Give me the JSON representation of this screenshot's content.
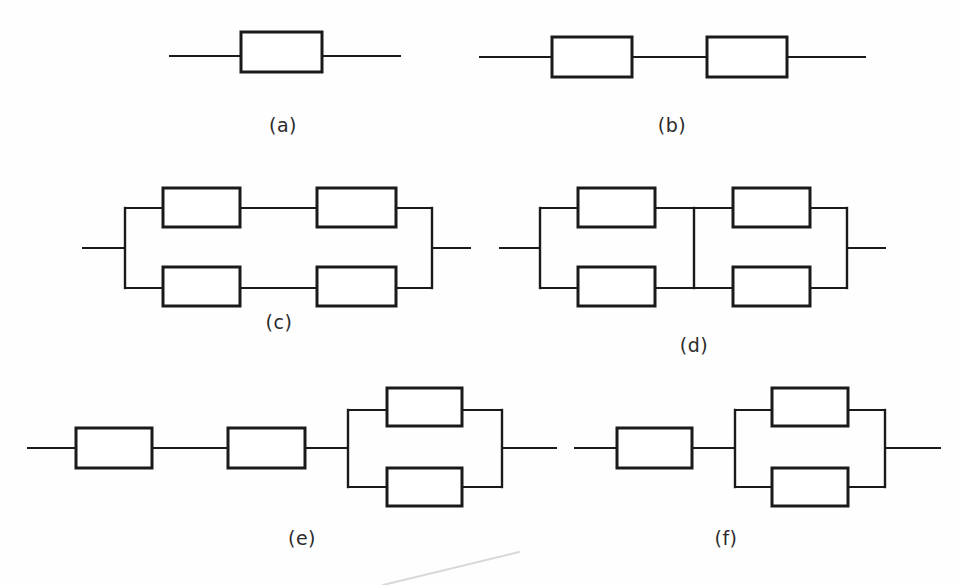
{
  "figure": {
    "background_color": "#fefefe",
    "line_color": "#1a1a1a",
    "block_fill": "#ffffff",
    "caption_color": "#2b2b2b",
    "width": 959,
    "height": 585,
    "block_count_total": 17,
    "stroke_width_block": 3,
    "stroke_width_wire": 2
  },
  "diagrams": [
    {
      "id": "a",
      "caption": "(a)",
      "caption_x": 283,
      "caption_y": 125,
      "topology": "single block in series",
      "block_count": 1,
      "blocks": [
        {
          "name": "block-a1",
          "x": 241,
          "y": 32,
          "w": 81,
          "h": 40
        }
      ],
      "wires": [
        {
          "name": "lead-in",
          "x1": 170,
          "y1": 56,
          "x2": 241,
          "y2": 56
        },
        {
          "name": "lead-out",
          "x1": 322,
          "y1": 56,
          "x2": 400,
          "y2": 56
        }
      ]
    },
    {
      "id": "b",
      "caption": "(b)",
      "caption_x": 672,
      "caption_y": 125,
      "topology": "two blocks in series",
      "block_count": 2,
      "blocks": [
        {
          "name": "block-b1",
          "x": 552,
          "y": 37,
          "w": 80,
          "h": 40
        },
        {
          "name": "block-b2",
          "x": 707,
          "y": 37,
          "w": 80,
          "h": 40
        }
      ],
      "wires": [
        {
          "name": "lead-in",
          "x1": 480,
          "y1": 57,
          "x2": 552,
          "y2": 57
        },
        {
          "name": "link-b1-b2",
          "x1": 632,
          "y1": 57,
          "x2": 707,
          "y2": 57
        },
        {
          "name": "lead-out",
          "x1": 787,
          "y1": 57,
          "x2": 865,
          "y2": 57
        }
      ]
    },
    {
      "id": "c",
      "caption": "(c)",
      "caption_x": 279,
      "caption_y": 322,
      "topology": "two parallel paths, each of two series blocks",
      "block_count": 4,
      "blocks": [
        {
          "name": "block-c1",
          "x": 163,
          "y": 188,
          "w": 77,
          "h": 39
        },
        {
          "name": "block-c2",
          "x": 317,
          "y": 188,
          "w": 79,
          "h": 39
        },
        {
          "name": "block-c3",
          "x": 163,
          "y": 267,
          "w": 77,
          "h": 39
        },
        {
          "name": "block-c4",
          "x": 317,
          "y": 267,
          "w": 79,
          "h": 39
        }
      ],
      "rails": [
        {
          "name": "left-rail",
          "x": 125,
          "y1": 208,
          "y2": 288
        },
        {
          "name": "right-rail",
          "x": 432,
          "y1": 208,
          "y2": 288
        }
      ],
      "wires": [
        {
          "name": "lead-in",
          "x1": 83,
          "y1": 248,
          "x2": 125,
          "y2": 248
        },
        {
          "name": "lead-out",
          "x1": 432,
          "y1": 248,
          "x2": 470,
          "y2": 248
        },
        {
          "name": "top-left-stub",
          "x1": 125,
          "y1": 208,
          "x2": 163,
          "y2": 208
        },
        {
          "name": "top-mid-link",
          "x1": 240,
          "y1": 208,
          "x2": 317,
          "y2": 208
        },
        {
          "name": "top-right-stub",
          "x1": 396,
          "y1": 208,
          "x2": 432,
          "y2": 208
        },
        {
          "name": "bottom-left-stub",
          "x1": 125,
          "y1": 288,
          "x2": 163,
          "y2": 288
        },
        {
          "name": "bottom-mid-link",
          "x1": 240,
          "y1": 288,
          "x2": 317,
          "y2": 288
        },
        {
          "name": "bottom-right-stub",
          "x1": 396,
          "y1": 288,
          "x2": 432,
          "y2": 288
        }
      ]
    },
    {
      "id": "d",
      "caption": "(d)",
      "caption_x": 694,
      "caption_y": 345,
      "topology": "bridge network - two parallel paths with cross link",
      "block_count": 4,
      "has_bridge": true,
      "blocks": [
        {
          "name": "block-d1",
          "x": 578,
          "y": 188,
          "w": 77,
          "h": 39
        },
        {
          "name": "block-d2",
          "x": 733,
          "y": 188,
          "w": 77,
          "h": 39
        },
        {
          "name": "block-d3",
          "x": 578,
          "y": 267,
          "w": 77,
          "h": 39
        },
        {
          "name": "block-d4",
          "x": 733,
          "y": 267,
          "w": 77,
          "h": 39
        }
      ],
      "rails": [
        {
          "name": "left-rail",
          "x": 540,
          "y1": 208,
          "y2": 288
        },
        {
          "name": "right-rail",
          "x": 847,
          "y1": 208,
          "y2": 288
        },
        {
          "name": "bridge-rail",
          "x": 694,
          "y1": 208,
          "y2": 288
        }
      ],
      "wires": [
        {
          "name": "lead-in",
          "x1": 500,
          "y1": 248,
          "x2": 540,
          "y2": 248
        },
        {
          "name": "lead-out",
          "x1": 847,
          "y1": 248,
          "x2": 885,
          "y2": 248
        },
        {
          "name": "top-left-stub",
          "x1": 540,
          "y1": 208,
          "x2": 578,
          "y2": 208
        },
        {
          "name": "top-mid-left-link",
          "x1": 655,
          "y1": 208,
          "x2": 694,
          "y2": 208
        },
        {
          "name": "top-mid-right-link",
          "x1": 694,
          "y1": 208,
          "x2": 733,
          "y2": 208
        },
        {
          "name": "top-right-stub",
          "x1": 810,
          "y1": 208,
          "x2": 847,
          "y2": 208
        },
        {
          "name": "bottom-left-stub",
          "x1": 540,
          "y1": 288,
          "x2": 578,
          "y2": 288
        },
        {
          "name": "bottom-mid-left-link",
          "x1": 655,
          "y1": 288,
          "x2": 694,
          "y2": 288
        },
        {
          "name": "bottom-mid-right-link",
          "x1": 694,
          "y1": 288,
          "x2": 733,
          "y2": 288
        },
        {
          "name": "bottom-right-stub",
          "x1": 810,
          "y1": 288,
          "x2": 847,
          "y2": 288
        }
      ]
    },
    {
      "id": "e",
      "caption": "(e)",
      "caption_x": 302,
      "caption_y": 538,
      "topology": "two series blocks followed by two parallel blocks",
      "block_count": 4,
      "blocks": [
        {
          "name": "block-e1",
          "x": 76,
          "y": 428,
          "w": 76,
          "h": 40
        },
        {
          "name": "block-e2",
          "x": 228,
          "y": 428,
          "w": 77,
          "h": 40
        },
        {
          "name": "block-e3",
          "x": 387,
          "y": 388,
          "w": 75,
          "h": 38
        },
        {
          "name": "block-e4",
          "x": 387,
          "y": 468,
          "w": 75,
          "h": 38
        }
      ],
      "rails": [
        {
          "name": "left-rail",
          "x": 348,
          "y1": 410,
          "y2": 487
        },
        {
          "name": "right-rail",
          "x": 502,
          "y1": 410,
          "y2": 487
        }
      ],
      "wires": [
        {
          "name": "lead-in",
          "x1": 28,
          "y1": 448,
          "x2": 76,
          "y2": 448
        },
        {
          "name": "link-e1-e2",
          "x1": 152,
          "y1": 448,
          "x2": 228,
          "y2": 448
        },
        {
          "name": "link-e2-rail",
          "x1": 305,
          "y1": 448,
          "x2": 348,
          "y2": 448
        },
        {
          "name": "lead-out",
          "x1": 502,
          "y1": 448,
          "x2": 556,
          "y2": 448
        },
        {
          "name": "top-left-stub",
          "x1": 348,
          "y1": 410,
          "x2": 387,
          "y2": 410
        },
        {
          "name": "top-right-stub",
          "x1": 462,
          "y1": 410,
          "x2": 502,
          "y2": 410
        },
        {
          "name": "bottom-left-stub",
          "x1": 348,
          "y1": 487,
          "x2": 387,
          "y2": 487
        },
        {
          "name": "bottom-right-stub",
          "x1": 462,
          "y1": 487,
          "x2": 502,
          "y2": 487
        }
      ]
    },
    {
      "id": "f",
      "caption": "(f)",
      "caption_x": 726,
      "caption_y": 538,
      "topology": "one series block followed by two parallel blocks",
      "block_count": 3,
      "blocks": [
        {
          "name": "block-f1",
          "x": 617,
          "y": 428,
          "w": 75,
          "h": 40
        },
        {
          "name": "block-f2",
          "x": 772,
          "y": 388,
          "w": 76,
          "h": 38
        },
        {
          "name": "block-f3",
          "x": 772,
          "y": 468,
          "w": 76,
          "h": 38
        }
      ],
      "rails": [
        {
          "name": "left-rail",
          "x": 735,
          "y1": 410,
          "y2": 487
        },
        {
          "name": "right-rail",
          "x": 885,
          "y1": 410,
          "y2": 487
        }
      ],
      "wires": [
        {
          "name": "lead-in",
          "x1": 575,
          "y1": 448,
          "x2": 617,
          "y2": 448
        },
        {
          "name": "link-f1-rail",
          "x1": 692,
          "y1": 448,
          "x2": 735,
          "y2": 448
        },
        {
          "name": "lead-out",
          "x1": 885,
          "y1": 448,
          "x2": 940,
          "y2": 448
        },
        {
          "name": "top-left-stub",
          "x1": 735,
          "y1": 410,
          "x2": 772,
          "y2": 410
        },
        {
          "name": "top-right-stub",
          "x1": 848,
          "y1": 410,
          "x2": 885,
          "y2": 410
        },
        {
          "name": "bottom-left-stub",
          "x1": 735,
          "y1": 487,
          "x2": 772,
          "y2": 487
        },
        {
          "name": "bottom-right-stub",
          "x1": 848,
          "y1": 487,
          "x2": 885,
          "y2": 487
        }
      ]
    }
  ],
  "artifacts": [
    {
      "name": "scan-streak",
      "x1": 383,
      "y1": 585,
      "x2": 519,
      "y2": 552,
      "color": "#d8d8d8"
    }
  ]
}
